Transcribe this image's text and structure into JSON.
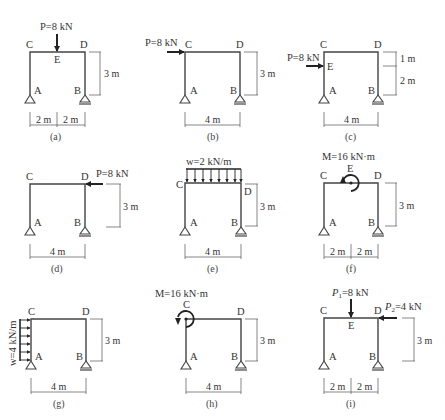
{
  "figure": {
    "panels": [
      {
        "id": "a",
        "caption": "(a)",
        "load": "P=8 kN",
        "load_type": "point-vertical-down",
        "load_at": "E",
        "nodes": [
          "C",
          "D",
          "E",
          "A",
          "B"
        ],
        "height": "3 m",
        "spans": [
          "2 m",
          "2 m"
        ]
      },
      {
        "id": "b",
        "caption": "(b)",
        "load": "P=8 kN",
        "load_type": "point-horizontal-right",
        "load_at": "C",
        "nodes": [
          "C",
          "D",
          "A",
          "B"
        ],
        "height": "3 m",
        "spans": [
          "4 m"
        ]
      },
      {
        "id": "c",
        "caption": "(c)",
        "load": "P=8 kN",
        "load_type": "point-horizontal-right",
        "load_at": "E",
        "nodes": [
          "C",
          "D",
          "E",
          "A",
          "B"
        ],
        "heights": [
          "1 m",
          "2 m"
        ],
        "spans": [
          "4 m"
        ]
      },
      {
        "id": "d",
        "caption": "(d)",
        "load": "P=8 kN",
        "load_type": "point-horizontal-left",
        "load_at": "D",
        "nodes": [
          "C",
          "D",
          "A",
          "B"
        ],
        "height": "3 m",
        "spans": [
          "4 m"
        ]
      },
      {
        "id": "e",
        "caption": "(e)",
        "load": "w=2 kN/m",
        "load_type": "distributed-vertical-down",
        "load_at": "CD",
        "nodes": [
          "C",
          "D",
          "A",
          "B"
        ],
        "height": "3 m",
        "spans": [
          "4 m"
        ]
      },
      {
        "id": "f",
        "caption": "(f)",
        "load": "M=16 kN·m",
        "load_type": "moment",
        "load_at": "E",
        "nodes": [
          "C",
          "D",
          "E",
          "A",
          "B"
        ],
        "height": "3 m",
        "spans": [
          "2 m",
          "2 m"
        ]
      },
      {
        "id": "g",
        "caption": "(g)",
        "load": "w=4 kN/m",
        "load_type": "distributed-horizontal-right",
        "load_at": "AC",
        "nodes": [
          "C",
          "D",
          "A",
          "B"
        ],
        "height": "3 m",
        "spans": [
          "4 m"
        ]
      },
      {
        "id": "h",
        "caption": "(h)",
        "load": "M=16 kN·m",
        "load_type": "moment",
        "load_at": "C",
        "nodes": [
          "C",
          "D",
          "A",
          "B"
        ],
        "height": "3 m",
        "spans": [
          "4 m"
        ]
      },
      {
        "id": "i",
        "caption": "(i)",
        "load": "P1=8 kN",
        "load2": "P2=4 kN",
        "load_type": "point-vertical-down + point-horizontal-left",
        "load_at": "E, D",
        "nodes": [
          "C",
          "D",
          "E",
          "A",
          "B"
        ],
        "height": "3 m",
        "spans": [
          "2 m",
          "2 m"
        ]
      }
    ],
    "text": {
      "P8": "P=8 kN",
      "w2": "w=2 kN/m",
      "w4": "w=4 kN/m",
      "M16": "M=16 kN·m",
      "P1": "P",
      "P1sub": "1",
      "P1val": "=8 kN",
      "P2": "P",
      "P2sub": "2",
      "P2val": "=4 kN",
      "m3": "3 m",
      "m2": "2 m",
      "m4": "4 m",
      "m1": "1 m",
      "A": "A",
      "B": "B",
      "C": "C",
      "D": "D",
      "E": "E",
      "cap_a": "(a)",
      "cap_b": "(b)",
      "cap_c": "(c)",
      "cap_d": "(d)",
      "cap_e": "(e)",
      "cap_f": "(f)",
      "cap_g": "(g)",
      "cap_h": "(h)",
      "cap_i": "(i)"
    }
  }
}
